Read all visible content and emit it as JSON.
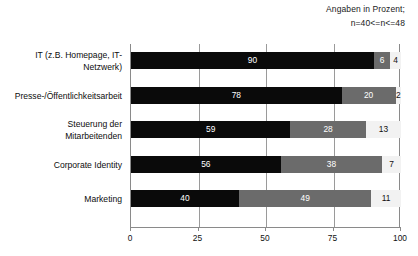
{
  "header": {
    "note_line_1": "Angaben in Prozent;",
    "note_line_2": "n=40<=n<=48"
  },
  "chart_data": {
    "type": "bar",
    "orientation": "horizontal",
    "stacked": true,
    "title": "",
    "subtitle": "Angaben in Prozent; n=40<=n<=48",
    "xlabel": "",
    "ylabel": "",
    "xlim": [
      0,
      100
    ],
    "xticks": [
      0,
      25,
      50,
      75,
      100
    ],
    "xtick_labels": [
      "0",
      "25",
      "50",
      "75",
      "100"
    ],
    "grid": true,
    "legend": "none",
    "categories": [
      "IT (z.B. Homepage, IT-Netzwerk)",
      "Presse-/Öffentlichkeitsarbeit",
      "Steuerung der Mitarbeitenden",
      "Corporate Identity",
      "Marketing"
    ],
    "series": [
      {
        "name": "segment-1",
        "color": "#0a0a0a",
        "values": [
          90,
          78,
          59,
          56,
          40
        ]
      },
      {
        "name": "segment-2",
        "color": "#6b6b6b",
        "values": [
          6,
          20,
          28,
          38,
          49
        ]
      },
      {
        "name": "segment-3",
        "color": "#f2f2f2",
        "values": [
          4,
          2,
          13,
          7,
          11
        ]
      }
    ],
    "value_labels": [
      [
        "90",
        "6",
        "4"
      ],
      [
        "78",
        "20",
        "2"
      ],
      [
        "59",
        "28",
        "13"
      ],
      [
        "56",
        "38",
        "7"
      ],
      [
        "40",
        "49",
        "11"
      ]
    ]
  },
  "rows": [
    {
      "label_line_1": "IT (z.B. Homepage, IT-",
      "label_line_2": "Netzwerk)"
    },
    {
      "label_line_1": "Presse-/Öffentlichkeitsarbeit",
      "label_line_2": ""
    },
    {
      "label_line_1": "Steuerung der",
      "label_line_2": "Mitarbeitenden"
    },
    {
      "label_line_1": "Corporate Identity",
      "label_line_2": ""
    },
    {
      "label_line_1": "Marketing",
      "label_line_2": ""
    }
  ]
}
